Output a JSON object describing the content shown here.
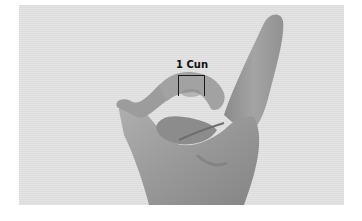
{
  "figure": {
    "label": "1 Cun",
    "colors": {
      "background": "#ffffff",
      "panel": "#e0e0e0",
      "skin_light": "#a8a8a8",
      "skin_mid": "#8f8f8f",
      "skin_dark": "#6e6e6e",
      "bracket": "#1a1a1a"
    }
  }
}
